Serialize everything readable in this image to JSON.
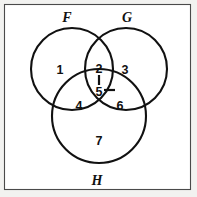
{
  "figure": {
    "background_color": "#f2f2f0",
    "panel_color": "#ffffff",
    "stroke_color": "#111111",
    "frame_color": "#4a4a4a"
  },
  "sets": [
    {
      "id": "F",
      "label": "F",
      "label_x": 67,
      "label_y": 17,
      "cx": 72,
      "cy": 69,
      "r": 41
    },
    {
      "id": "G",
      "label": "G",
      "label_x": 127,
      "label_y": 17,
      "cx": 126,
      "cy": 69,
      "r": 41
    },
    {
      "id": "H",
      "label": "H",
      "label_x": 97,
      "label_y": 180,
      "cx": 99,
      "cy": 116,
      "r": 47
    }
  ],
  "regions": [
    {
      "id": "r1",
      "label": "1",
      "x": 60,
      "y": 70,
      "sets": "F only"
    },
    {
      "id": "r2",
      "label": "2",
      "x": 99,
      "y": 69,
      "sets": "F and G"
    },
    {
      "id": "r3",
      "label": "3",
      "x": 125,
      "y": 70,
      "sets": "G only"
    },
    {
      "id": "r4",
      "label": "4",
      "x": 79,
      "y": 106,
      "sets": "F and H"
    },
    {
      "id": "r5",
      "label": "5",
      "x": 99,
      "y": 92,
      "sets": "F and G and H"
    },
    {
      "id": "r6",
      "label": "6",
      "x": 120,
      "y": 106,
      "sets": "G and H"
    },
    {
      "id": "r7",
      "label": "7",
      "x": 99,
      "y": 141,
      "sets": "H only"
    }
  ],
  "tick_marks": [
    {
      "id": "t1",
      "x1": 99,
      "y1": 75,
      "x2": 99,
      "y2": 85,
      "orientation": "vertical"
    },
    {
      "id": "t2",
      "x1": 104,
      "y1": 90,
      "x2": 115,
      "y2": 90,
      "orientation": "horizontal"
    }
  ],
  "frame": {
    "x": 4.5,
    "y": 4.5,
    "width": 186,
    "height": 185
  }
}
